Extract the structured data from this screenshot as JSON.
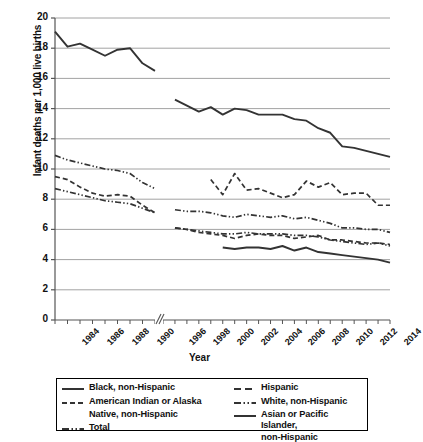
{
  "chart_data": {
    "type": "line",
    "title": "",
    "xlabel": "Year",
    "ylabel": "Infant deaths per 1,000 live births",
    "ylim": [
      0,
      20
    ],
    "ytick_labels": [
      "0",
      "2",
      "4",
      "6",
      "8",
      "10",
      "12",
      "14",
      "16",
      "18",
      "20"
    ],
    "ytick_values": [
      0,
      2,
      4,
      6,
      8,
      10,
      12,
      14,
      16,
      18,
      20
    ],
    "grid": "horizontal",
    "axis_break": true,
    "axis_break_note": "x-axis break between 1991 and 1995",
    "x_segments": [
      {
        "name": "early",
        "years": [
          1983,
          1984,
          1985,
          1986,
          1987,
          1988,
          1989,
          1990,
          1991
        ]
      },
      {
        "name": "late",
        "years": [
          1995,
          1996,
          1997,
          1998,
          1999,
          2000,
          2001,
          2002,
          2003,
          2004,
          2005,
          2006,
          2007,
          2008,
          2009,
          2010,
          2011,
          2012,
          2013,
          2014
        ]
      }
    ],
    "xtick_labels": [
      "1984",
      "1986",
      "1988",
      "1990",
      "1996",
      "1998",
      "2000",
      "2002",
      "2004",
      "2006",
      "2008",
      "2010",
      "2012",
      "2014"
    ],
    "legend_position": "below",
    "series": [
      {
        "name": "Black, non-Hispanic",
        "style": "solid",
        "x": [
          1983,
          1984,
          1985,
          1986,
          1987,
          1988,
          1989,
          1990,
          1991,
          1996,
          1997,
          1998,
          1999,
          2000,
          2001,
          2002,
          2003,
          2004,
          2005,
          2006,
          2007,
          2008,
          2009,
          2010,
          2011,
          2012,
          2013,
          2014
        ],
        "values": [
          19.1,
          18.1,
          18.3,
          17.9,
          17.5,
          17.9,
          18.0,
          17.0,
          16.5,
          14.6,
          14.2,
          13.8,
          14.1,
          13.6,
          14.0,
          13.9,
          13.6,
          13.6,
          13.6,
          13.3,
          13.2,
          12.7,
          12.4,
          11.5,
          11.4,
          11.2,
          11.0,
          10.8
        ]
      },
      {
        "name": "American Indian or Alaska Native, non-Hispanic",
        "style": "dashed",
        "x": [
          1999,
          2000,
          2001,
          2002,
          2003,
          2004,
          2005,
          2006,
          2007,
          2008,
          2009,
          2010,
          2011,
          2012,
          2013,
          2014
        ],
        "values": [
          9.3,
          8.3,
          9.7,
          8.6,
          8.7,
          8.4,
          8.1,
          8.3,
          9.2,
          8.8,
          9.1,
          8.3,
          8.4,
          8.4,
          7.6,
          7.6
        ]
      },
      {
        "name": "Total",
        "style": "dash-dot-dot",
        "x": [
          1983,
          1984,
          1985,
          1986,
          1987,
          1988,
          1989,
          1990,
          1991,
          1996,
          1997,
          1998,
          1999,
          2000,
          2001,
          2002,
          2003,
          2004,
          2005,
          2006,
          2007,
          2008,
          2009,
          2010,
          2011,
          2012,
          2013,
          2014
        ],
        "values": [
          10.9,
          10.6,
          10.4,
          10.2,
          10.0,
          9.9,
          9.7,
          9.1,
          8.7,
          7.3,
          7.2,
          7.2,
          7.1,
          6.9,
          6.8,
          7.0,
          6.9,
          6.8,
          6.9,
          6.7,
          6.8,
          6.6,
          6.4,
          6.1,
          6.1,
          6.0,
          6.0,
          5.8
        ]
      },
      {
        "name": "Hispanic",
        "style": "dashed",
        "x": [
          1983,
          1984,
          1985,
          1986,
          1987,
          1988,
          1989,
          1990,
          1991,
          1996,
          1997,
          1998,
          1999,
          2000,
          2001,
          2002,
          2003,
          2004,
          2005,
          2006,
          2007,
          2008,
          2009,
          2010,
          2011,
          2012,
          2013,
          2014
        ],
        "values": [
          9.5,
          9.3,
          8.8,
          8.4,
          8.2,
          8.3,
          8.2,
          7.6,
          7.1,
          6.1,
          6.0,
          5.8,
          5.7,
          5.6,
          5.4,
          5.6,
          5.7,
          5.6,
          5.6,
          5.4,
          5.5,
          5.6,
          5.3,
          5.3,
          5.2,
          5.1,
          5.1,
          5.0
        ]
      },
      {
        "name": "White, non-Hispanic",
        "style": "dash-dot-dot",
        "x": [
          1983,
          1984,
          1985,
          1986,
          1987,
          1988,
          1989,
          1990,
          1991,
          1996,
          1997,
          1998,
          1999,
          2000,
          2001,
          2002,
          2003,
          2004,
          2005,
          2006,
          2007,
          2008,
          2009,
          2010,
          2011,
          2012,
          2013,
          2014
        ],
        "values": [
          8.7,
          8.5,
          8.3,
          8.1,
          7.9,
          7.8,
          7.7,
          7.4,
          7.1,
          6.1,
          6.0,
          5.9,
          5.8,
          5.7,
          5.7,
          5.8,
          5.7,
          5.7,
          5.7,
          5.6,
          5.6,
          5.5,
          5.3,
          5.2,
          5.1,
          5.0,
          5.1,
          4.9
        ]
      },
      {
        "name": "Asian or Pacific Islander, non-Hispanic",
        "style": "solid",
        "x": [
          2000,
          2001,
          2002,
          2003,
          2004,
          2005,
          2006,
          2007,
          2008,
          2009,
          2010,
          2011,
          2012,
          2013,
          2014
        ],
        "values": [
          4.8,
          4.7,
          4.8,
          4.8,
          4.7,
          4.9,
          4.6,
          4.8,
          4.5,
          4.4,
          4.3,
          4.2,
          4.1,
          4.0,
          3.8
        ]
      }
    ]
  },
  "axis": {
    "ylabel": "Infant deaths per 1,000 live births",
    "xlabel": "Year"
  },
  "legend": {
    "left_column": [
      {
        "label": "Black, non-Hispanic",
        "style": "solid"
      },
      {
        "label": "American Indian or Alaska",
        "label2": "Native, non-Hispanic",
        "style": "dashed"
      },
      {
        "label": "Total",
        "style": "dash-dot-dot"
      }
    ],
    "right_column": [
      {
        "label": "Hispanic",
        "style": "dashed"
      },
      {
        "label": "White, non-Hispanic",
        "style": "dash-dot-dot"
      },
      {
        "label": "Asian or Pacific Islander,",
        "label2": "non-Hispanic",
        "style": "solid"
      }
    ]
  },
  "colors": {
    "line": "#333333",
    "grid": "#8a8a8a",
    "axis": "#555555",
    "text": "#111111"
  }
}
